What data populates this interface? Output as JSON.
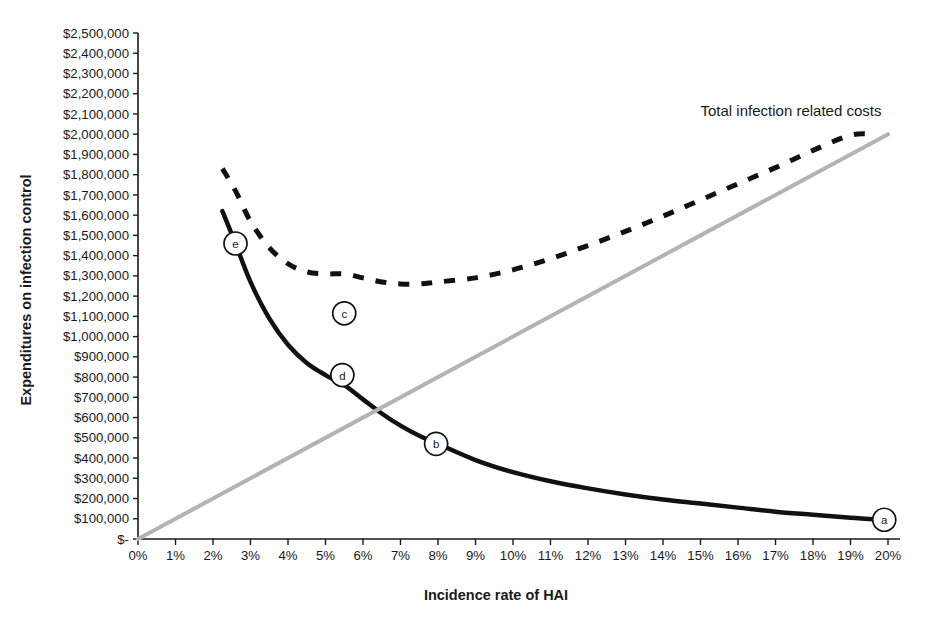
{
  "chart_data": {
    "type": "line",
    "title": "",
    "xlabel": "Incidence rate of HAI",
    "ylabel": "Expenditures on infection control",
    "xlim": [
      0,
      20
    ],
    "ylim": [
      0,
      2500000
    ],
    "grid": false,
    "legend_position": "inline-annotation",
    "x_tick_labels": [
      "0%",
      "1%",
      "2%",
      "3%",
      "4%",
      "5%",
      "6%",
      "7%",
      "8%",
      "9%",
      "10%",
      "11%",
      "12%",
      "13%",
      "14%",
      "15%",
      "16%",
      "17%",
      "18%",
      "19%",
      "20%"
    ],
    "x_tick_values": [
      0,
      1,
      2,
      3,
      4,
      5,
      6,
      7,
      8,
      9,
      10,
      11,
      12,
      13,
      14,
      15,
      16,
      17,
      18,
      19,
      20
    ],
    "y_tick_labels": [
      "$2,500,000",
      "$2,400,000",
      "$2,300,000",
      "$2,200,000",
      "$2,100,000",
      "$2,000,000",
      "$1,900,000",
      "$1,800,000",
      "$1,700,000",
      "$1,600,000",
      "$1,500,000",
      "$1,400,000",
      "$1,300,000",
      "$1,200,000",
      "$1,100,000",
      "$1,000,000",
      "$900,000",
      "$800,000",
      "$700,000",
      "$600,000",
      "$500,000",
      "$400,000",
      "$300,000",
      "$200,000",
      "$100,000",
      "$-"
    ],
    "y_tick_values": [
      2500000,
      2400000,
      2300000,
      2200000,
      2100000,
      2000000,
      1900000,
      1800000,
      1700000,
      1600000,
      1500000,
      1400000,
      1300000,
      1200000,
      1100000,
      1000000,
      900000,
      800000,
      700000,
      600000,
      500000,
      400000,
      300000,
      200000,
      100000,
      0
    ],
    "annotations": [
      {
        "text": "Total infection related costs",
        "x": 15.0,
        "y": 2090000
      }
    ],
    "series": [
      {
        "name": "Expenditures on infection control",
        "style": "solid",
        "color": "#111111",
        "width": 4.5,
        "x": [
          2.25,
          2.6,
          3.0,
          3.5,
          4.0,
          4.5,
          5.0,
          5.5,
          6.0,
          6.5,
          7.0,
          7.5,
          8.0,
          9.0,
          10.0,
          11.0,
          12.0,
          13.0,
          14.0,
          15.0,
          16.0,
          17.0,
          18.0,
          19.0,
          19.9
        ],
        "values": [
          1620000,
          1460000,
          1270000,
          1090000,
          960000,
          870000,
          810000,
          760000,
          690000,
          620000,
          560000,
          510000,
          470000,
          390000,
          330000,
          285000,
          250000,
          220000,
          195000,
          175000,
          155000,
          135000,
          120000,
          105000,
          95000
        ]
      },
      {
        "name": "Cost of infections",
        "style": "solid-gray",
        "color": "#b3b3b3",
        "width": 4.0,
        "x": [
          0,
          20
        ],
        "values": [
          0,
          2000000
        ]
      },
      {
        "name": "Total infection related costs",
        "style": "dashed",
        "color": "#111111",
        "width": 5.0,
        "x": [
          2.25,
          2.6,
          3.0,
          3.5,
          4.0,
          4.5,
          5.0,
          5.5,
          6.0,
          6.5,
          7.0,
          7.5,
          8.0,
          9.0,
          10.0,
          11.0,
          12.0,
          13.0,
          14.0,
          15.0,
          16.0,
          17.0,
          18.0,
          19.0,
          19.6
        ],
        "values": [
          1830000,
          1720000,
          1570000,
          1440000,
          1360000,
          1320000,
          1310000,
          1310000,
          1290000,
          1270000,
          1260000,
          1260000,
          1270000,
          1290000,
          1330000,
          1385000,
          1450000,
          1520000,
          1595000,
          1675000,
          1755000,
          1835000,
          1920000,
          1995000,
          2000000
        ]
      }
    ],
    "markers": [
      {
        "label": "a",
        "x": 19.9,
        "y": 95000
      },
      {
        "label": "b",
        "x": 7.95,
        "y": 470000
      },
      {
        "label": "c",
        "x": 5.5,
        "y": 1115000
      },
      {
        "label": "d",
        "x": 5.45,
        "y": 810000
      },
      {
        "label": "e",
        "x": 2.6,
        "y": 1460000
      }
    ]
  }
}
